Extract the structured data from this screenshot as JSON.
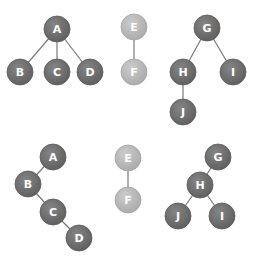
{
  "colors": {
    "dark_node": "#6d6d6d",
    "dark_node_edge": "#5a5a5a",
    "light_node": "#b9b9b9",
    "light_node_edge": "#a6a6a6",
    "edge": "#7a7a7a",
    "label": "#ffffff"
  },
  "node_radius": 13,
  "graphs": [
    {
      "name": "tree-top-left",
      "nodes": [
        {
          "id": "A",
          "x": 57,
          "y": 29,
          "style": "dark"
        },
        {
          "id": "B",
          "x": 20,
          "y": 72,
          "style": "dark"
        },
        {
          "id": "C",
          "x": 57,
          "y": 72,
          "style": "dark"
        },
        {
          "id": "D",
          "x": 90,
          "y": 72,
          "style": "dark"
        }
      ],
      "edges": [
        [
          "A",
          "B"
        ],
        [
          "A",
          "C"
        ],
        [
          "A",
          "D"
        ]
      ]
    },
    {
      "name": "tree-top-middle",
      "nodes": [
        {
          "id": "E",
          "x": 134,
          "y": 27,
          "style": "light"
        },
        {
          "id": "F",
          "x": 134,
          "y": 72,
          "style": "light"
        }
      ],
      "edges": [
        [
          "E",
          "F"
        ]
      ]
    },
    {
      "name": "tree-top-right",
      "nodes": [
        {
          "id": "G",
          "x": 207,
          "y": 28,
          "style": "dark"
        },
        {
          "id": "H",
          "x": 183,
          "y": 72,
          "style": "dark"
        },
        {
          "id": "I",
          "x": 233,
          "y": 72,
          "style": "dark"
        },
        {
          "id": "J",
          "x": 183,
          "y": 112,
          "style": "dark"
        }
      ],
      "edges": [
        [
          "G",
          "H"
        ],
        [
          "G",
          "I"
        ],
        [
          "H",
          "J"
        ]
      ]
    },
    {
      "name": "tree-bottom-left",
      "nodes": [
        {
          "id": "A",
          "x": 53,
          "y": 157,
          "style": "dark"
        },
        {
          "id": "B",
          "x": 28,
          "y": 184,
          "style": "dark"
        },
        {
          "id": "C",
          "x": 53,
          "y": 212,
          "style": "dark"
        },
        {
          "id": "D",
          "x": 79,
          "y": 238,
          "style": "dark"
        }
      ],
      "edges": [
        [
          "A",
          "B"
        ],
        [
          "B",
          "C"
        ],
        [
          "C",
          "D"
        ]
      ]
    },
    {
      "name": "tree-bottom-middle",
      "nodes": [
        {
          "id": "E",
          "x": 128,
          "y": 158,
          "style": "light"
        },
        {
          "id": "F",
          "x": 128,
          "y": 200,
          "style": "light"
        }
      ],
      "edges": [
        [
          "E",
          "F"
        ]
      ]
    },
    {
      "name": "tree-bottom-right",
      "nodes": [
        {
          "id": "G",
          "x": 218,
          "y": 157,
          "style": "dark"
        },
        {
          "id": "H",
          "x": 200,
          "y": 185,
          "style": "dark"
        },
        {
          "id": "J",
          "x": 178,
          "y": 216,
          "style": "dark"
        },
        {
          "id": "I",
          "x": 222,
          "y": 216,
          "style": "dark"
        }
      ],
      "edges": [
        [
          "G",
          "H"
        ],
        [
          "H",
          "J"
        ],
        [
          "H",
          "I"
        ]
      ]
    }
  ]
}
